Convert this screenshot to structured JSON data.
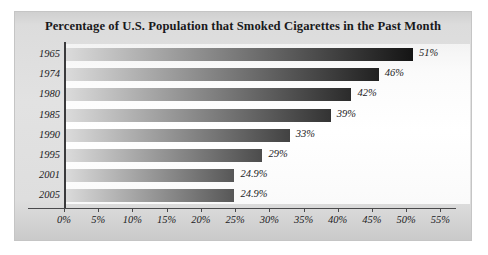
{
  "chart_data": {
    "type": "bar",
    "orientation": "horizontal",
    "title": "Percentage of U.S. Population that Smoked Cigarettes in the Past Month",
    "xlabel": "",
    "ylabel": "",
    "categories": [
      "1965",
      "1974",
      "1980",
      "1985",
      "1990",
      "1995",
      "2001",
      "2005"
    ],
    "values": [
      51,
      46,
      42,
      39,
      33,
      29,
      24.9,
      24.9
    ],
    "value_labels": [
      "51%",
      "46%",
      "42%",
      "39%",
      "33%",
      "29%",
      "24.9%",
      "24.9%"
    ],
    "xlim": [
      0,
      55
    ],
    "xticks": [
      0,
      5,
      10,
      15,
      20,
      25,
      30,
      35,
      40,
      45,
      50,
      55
    ],
    "xtick_labels": [
      "0%",
      "5%",
      "10%",
      "15%",
      "20%",
      "25%",
      "30%",
      "35%",
      "40%",
      "45%",
      "50%",
      "55%"
    ],
    "grid": false,
    "legend": null,
    "bar_gradient_start": "#dcdcdc",
    "bar_gradient_end": "#131313",
    "panel_background": "#e0e0e0",
    "plot_background": "#fdfdfd",
    "axis_color": "#3a3a3c",
    "text_color": "#1b1b1d"
  }
}
